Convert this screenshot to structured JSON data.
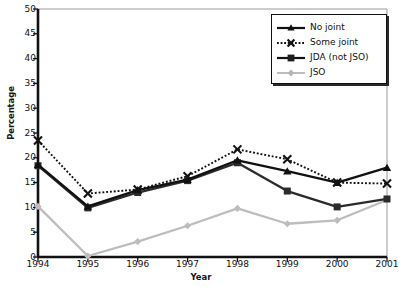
{
  "chart_data": {
    "type": "line",
    "title": "",
    "xlabel": "Year",
    "ylabel": "Percentage",
    "categories": [
      "1994",
      "1995",
      "1996",
      "1997",
      "1998",
      "1999",
      "2000",
      "2001"
    ],
    "x": [
      1994,
      1995,
      1996,
      1997,
      1998,
      1999,
      2000,
      2001
    ],
    "xlim": [
      1994,
      2001
    ],
    "ylim": [
      0,
      50
    ],
    "yticks": [
      0,
      5,
      10,
      15,
      20,
      25,
      30,
      35,
      40,
      45,
      50
    ],
    "ytick_labels": [
      "0",
      "5",
      "10",
      "15",
      "20",
      "25",
      "30",
      "35",
      "40",
      "45",
      "50"
    ],
    "grid": false,
    "legend_position": "top-right",
    "series": [
      {
        "name": "No joint",
        "values": [
          18.6,
          10.2,
          13.5,
          15.6,
          19.5,
          17.3,
          15.0,
          18.0
        ],
        "color": "#111111",
        "marker": "triangle",
        "line_style": "solid"
      },
      {
        "name": "Some joint",
        "values": [
          23.5,
          12.8,
          13.6,
          16.3,
          21.7,
          19.7,
          15.0,
          14.8
        ],
        "color": "#111111",
        "marker": "x",
        "line_style": "dotted"
      },
      {
        "name": "JDA (not JSO)",
        "values": [
          18.4,
          9.9,
          13.0,
          15.4,
          19.0,
          13.3,
          10.1,
          11.7
        ],
        "color": "#2b2b2b",
        "marker": "square",
        "line_style": "solid"
      },
      {
        "name": "JSO",
        "values": [
          10.2,
          0.2,
          3.1,
          6.3,
          9.8,
          6.7,
          7.4,
          11.5
        ],
        "color": "#bdbdbd",
        "marker": "diamond",
        "line_style": "solid"
      }
    ]
  },
  "legend": {
    "items": [
      {
        "label": "No joint"
      },
      {
        "label": "Some joint"
      },
      {
        "label": "JDA (not JSO)"
      },
      {
        "label": "JSO"
      }
    ]
  },
  "colors": {
    "axis": "#111111",
    "background": "#ffffff",
    "series_dark": "#111111",
    "series_gray": "#bdbdbd"
  }
}
